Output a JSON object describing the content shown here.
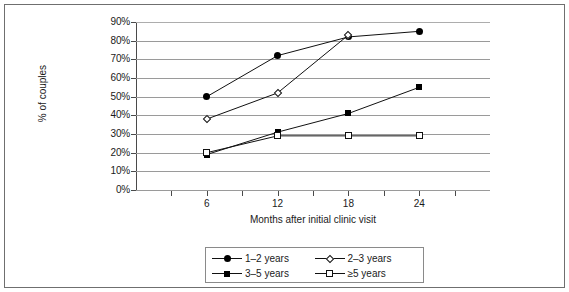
{
  "chart_data": {
    "type": "line",
    "title": "",
    "xlabel": "Months after initial clinic visit",
    "ylabel": "% of couples",
    "categories": [
      "6",
      "12",
      "18",
      "24"
    ],
    "x": [
      6,
      12,
      18,
      24
    ],
    "xlim": [
      0,
      30
    ],
    "ylim": [
      0,
      90
    ],
    "ytick_labels": [
      "90%",
      "80%",
      "70%",
      "60%",
      "50%",
      "40%",
      "30%",
      "20%",
      "10%",
      "0%"
    ],
    "ytick_values": [
      90,
      80,
      70,
      60,
      50,
      40,
      30,
      20,
      10,
      0
    ],
    "grid": true,
    "legend_position": "bottom",
    "series": [
      {
        "name": "1–2 years",
        "marker": "circle-filled",
        "x": [
          6,
          12,
          18,
          24
        ],
        "values": [
          50,
          72,
          82,
          85
        ]
      },
      {
        "name": "2–3 years",
        "marker": "diamond-open",
        "x": [
          6,
          12,
          18
        ],
        "values": [
          38,
          52,
          83
        ]
      },
      {
        "name": "3–5 years",
        "marker": "square-filled",
        "x": [
          6,
          12,
          18,
          24
        ],
        "values": [
          19,
          31,
          41,
          55
        ]
      },
      {
        "name": "≥5 years",
        "marker": "square-open",
        "x": [
          6,
          12,
          18,
          24
        ],
        "values": [
          20,
          29,
          29,
          29
        ]
      }
    ]
  },
  "axes": {
    "y_title": "% of couples",
    "x_title": "Months after initial clinic visit",
    "y_labels": [
      "90%",
      "80%",
      "70%",
      "60%",
      "50%",
      "40%",
      "30%",
      "20%",
      "10%",
      "0%"
    ],
    "x_labels": [
      "6",
      "12",
      "18",
      "24"
    ]
  },
  "legend": {
    "items": [
      {
        "label": "1–2 years",
        "marker": "circle-filled"
      },
      {
        "label": "2–3 years",
        "marker": "diamond-open"
      },
      {
        "label": "3–5 years",
        "marker": "square-filled"
      },
      {
        "label": "≥5 years",
        "marker": "square-open"
      }
    ]
  }
}
